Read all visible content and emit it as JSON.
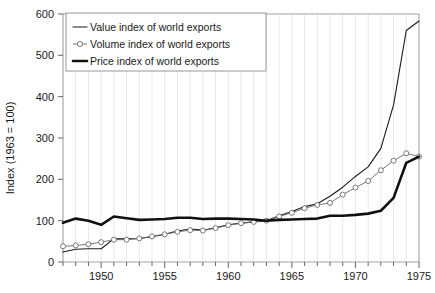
{
  "chart_data": {
    "type": "line",
    "title": "",
    "xlabel": "",
    "ylabel": "Index (1963 = 100)",
    "xlim": [
      1947,
      1975
    ],
    "ylim": [
      0,
      600
    ],
    "ytick_step": 100,
    "yticks": [
      0,
      100,
      200,
      300,
      400,
      500,
      600
    ],
    "xticks_labeled": [
      1950,
      1955,
      1960,
      1965,
      1970,
      1975
    ],
    "xticks_minor_step": 1,
    "grid": true,
    "grid_axis": "x",
    "legend_position": "top-left",
    "x": [
      1947,
      1948,
      1949,
      1950,
      1951,
      1952,
      1953,
      1954,
      1955,
      1956,
      1957,
      1958,
      1959,
      1960,
      1961,
      1962,
      1963,
      1964,
      1965,
      1966,
      1967,
      1968,
      1969,
      1970,
      1971,
      1972,
      1973,
      1974,
      1975
    ],
    "series": [
      {
        "name": "Value index of world exports",
        "values": [
          24,
          31,
          32,
          32,
          56,
          56,
          57,
          61,
          67,
          75,
          80,
          77,
          83,
          90,
          94,
          97,
          100,
          112,
          122,
          134,
          141,
          159,
          181,
          207,
          230,
          275,
          380,
          560,
          583
        ],
        "color": "#1a1a1a",
        "line_width": 1.1,
        "marker": "none"
      },
      {
        "name": "Volume index of world exports",
        "values": [
          38,
          40,
          43,
          48,
          54,
          54,
          57,
          62,
          67,
          73,
          77,
          76,
          82,
          89,
          94,
          97,
          100,
          110,
          119,
          130,
          138,
          143,
          163,
          180,
          196,
          222,
          245,
          263,
          255
        ],
        "color": "#6a6a6a",
        "line_width": 0.9,
        "marker": "circle-open"
      },
      {
        "name": "Price index of world exports",
        "values": [
          95,
          105,
          100,
          90,
          110,
          106,
          102,
          103,
          104,
          107,
          107,
          104,
          105,
          105,
          104,
          103,
          100,
          102,
          103,
          104,
          105,
          112,
          112,
          114,
          117,
          124,
          155,
          240,
          255
        ],
        "color": "#111111",
        "line_width": 2.6,
        "marker": "none"
      }
    ]
  },
  "legend": {
    "items": [
      {
        "label": "Value index of world exports",
        "style": "thin-line"
      },
      {
        "label": "Volume index of world exports",
        "style": "marker-line"
      },
      {
        "label": "Price index of world exports",
        "style": "thick-line"
      }
    ]
  },
  "axes": {
    "y_title": "Index (1963 = 100)",
    "y_tick_labels": [
      "600",
      "500",
      "400",
      "300",
      "200",
      "100",
      "0"
    ],
    "x_tick_labels": [
      "1950",
      "1955",
      "1960",
      "1965",
      "1970",
      "1975"
    ]
  },
  "colors": {
    "plot_border": "#9a9a9a",
    "grid": "#d8d8d8",
    "text": "#1a1a1a",
    "value_line": "#1a1a1a",
    "volume_line": "#6a6a6a",
    "price_line": "#111111",
    "legend_border": "#8c8c8c",
    "background": "#ffffff"
  }
}
